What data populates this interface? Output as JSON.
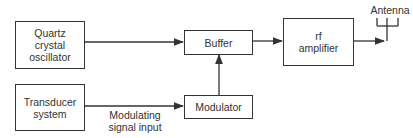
{
  "diagram": {
    "blocks": {
      "oscillator": {
        "label": "Quartz\ncrystal\noscillator"
      },
      "buffer": {
        "label": "Buffer"
      },
      "rf_amplifier": {
        "label": "rf\namplifier"
      },
      "transducer": {
        "label": "Transducer\nsystem"
      },
      "modulator": {
        "label": "Modulator"
      }
    },
    "labels": {
      "antenna": "Antenna",
      "modulating_signal": "Modulating\nsignal input"
    },
    "connections": [
      {
        "from": "Quartz crystal oscillator",
        "to": "Buffer"
      },
      {
        "from": "Buffer",
        "to": "rf amplifier"
      },
      {
        "from": "rf amplifier",
        "to": "Antenna"
      },
      {
        "from": "Transducer system",
        "to": "Modulator",
        "label": "Modulating signal input"
      },
      {
        "from": "Modulator",
        "to": "Buffer"
      }
    ],
    "colors": {
      "line": "#333333",
      "background": "#ffffff"
    }
  }
}
